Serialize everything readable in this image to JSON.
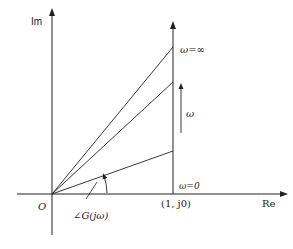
{
  "diagram": {
    "axes": {
      "im_label": "Im",
      "re_label": "Re",
      "origin_label": "O"
    },
    "point_label": "(1, j0)",
    "omega_inf_label": "ω=∞",
    "omega_zero_label": "ω=0",
    "omega_direction_label": "ω",
    "angle_label": "∠G(jω)",
    "colors": {
      "line": "#222222",
      "background": "#ffffff"
    }
  }
}
